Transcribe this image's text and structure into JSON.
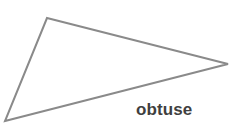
{
  "figure": {
    "name": "obtuse-triangle-diagram",
    "width": 230,
    "height": 136,
    "background_color": "#ffffff"
  },
  "label": {
    "text": "obtuse",
    "color": "#3f3f3f",
    "font_size_px": 17,
    "font_weight": "bold",
    "position": {
      "x": 136,
      "y": 100
    }
  },
  "chart_data": {
    "type": "diagram",
    "title": "",
    "shape": "triangle",
    "classification": "obtuse",
    "stroke_color": "#8a8a8a",
    "stroke_width": 2,
    "fill": "none",
    "annotations": [
      "obtuse"
    ],
    "vertices": [
      {
        "name": "apex",
        "x": 47,
        "y": 18
      },
      {
        "name": "right",
        "x": 228,
        "y": 64
      },
      {
        "name": "bottom-left",
        "x": 5,
        "y": 121
      }
    ],
    "edges": [
      {
        "from": "apex",
        "to": "right"
      },
      {
        "from": "right",
        "to": "bottom-left"
      },
      {
        "from": "bottom-left",
        "to": "apex"
      }
    ],
    "points_path": "47,18 228,64 5,121"
  }
}
